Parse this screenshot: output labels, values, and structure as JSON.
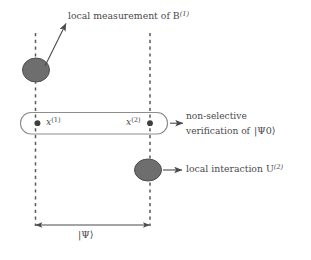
{
  "figure": {
    "type": "diagram",
    "background_color": "#ffffff",
    "ink_color": "#4a4a4a",
    "blob_fill_color": "#6e6e6e",
    "blob_stroke_color": "#4f4f4f",
    "labels": {
      "measurement": "local measurement of B",
      "measurement_superscript": "(1)",
      "verification_line1": "non-selective",
      "verification_line2": "verification of",
      "verification_state": "|Ψ0⟩",
      "interaction": "local interaction U",
      "interaction_superscript": "(2)",
      "global_state": "|Ψ⟩",
      "point_1": "x",
      "point_1_superscript": "(1)",
      "point_2": "x",
      "point_2_superscript": "(2)"
    },
    "elements": {
      "worldline_left": "dashed vertical line at x1",
      "worldline_right": "dashed vertical line at x2",
      "measurement_blob": "shaded ellipse on left worldline",
      "interaction_blob": "shaded ellipse on right worldline",
      "verification_region": "rounded horizontal capsule spanning both worldlines",
      "separation_arrow": "double-headed horizontal arrow between worldlines"
    }
  }
}
